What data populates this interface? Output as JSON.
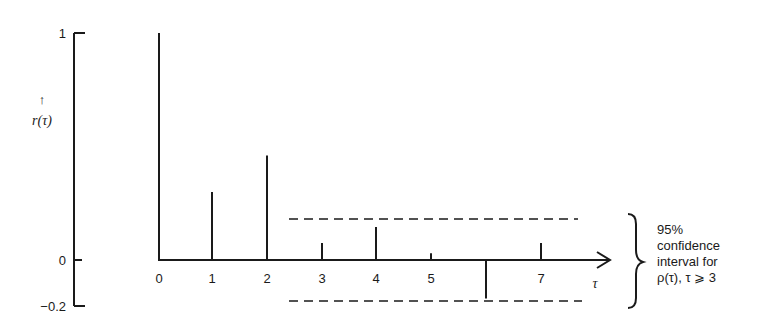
{
  "chart_data": {
    "type": "bar",
    "subtype": "stem / correlogram",
    "title": "",
    "xlabel": "τ",
    "ylabel": "r(τ)",
    "ylabel_arrow": "↑",
    "x": [
      0,
      1,
      2,
      3,
      4,
      5,
      6,
      7
    ],
    "x_tick_labels": [
      "0",
      "1",
      "2",
      "3",
      "4",
      "5",
      "",
      "7"
    ],
    "values": [
      1.0,
      0.3,
      0.46,
      0.075,
      0.145,
      0.03,
      -0.17,
      0.075
    ],
    "y_tick_values": [
      1,
      0,
      -0.2
    ],
    "y_tick_labels": [
      "1",
      "0",
      "−0.2"
    ],
    "ylim": [
      -0.2,
      1
    ],
    "grid": false,
    "confidence_band": {
      "upper": 0.18,
      "lower": -0.18,
      "applies_from_lag": 3,
      "style": "dashed"
    },
    "annotation": {
      "lines": [
        "95%",
        "confidence",
        "interval for",
        "ρ(τ), τ ⩾ 3"
      ]
    }
  }
}
